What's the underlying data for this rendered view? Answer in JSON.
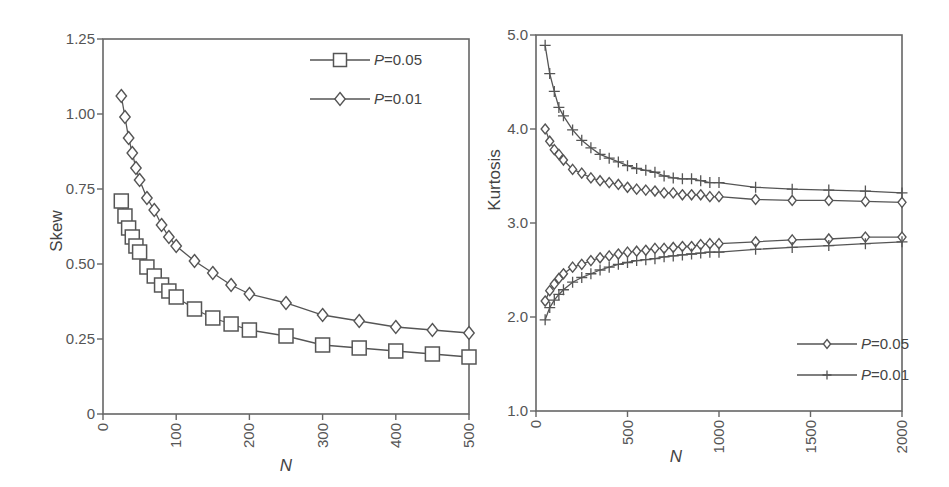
{
  "chart_data": [
    {
      "type": "line",
      "title": "",
      "xlabel": "N",
      "ylabel": "Skew",
      "xlim": [
        0,
        500
      ],
      "ylim": [
        0,
        1.25
      ],
      "xticks": [
        "0",
        "100",
        "200",
        "300",
        "400",
        "500"
      ],
      "yticks": [
        "0",
        "0.25",
        "0.50",
        "0.75",
        "1.00",
        "1.25"
      ],
      "grid": false,
      "legend_position": "upper right",
      "series": [
        {
          "name": "P=0.05",
          "marker": "square",
          "x": [
            25,
            30,
            35,
            40,
            45,
            50,
            60,
            70,
            80,
            90,
            100,
            125,
            150,
            175,
            200,
            250,
            300,
            350,
            400,
            450,
            500
          ],
          "values": [
            0.71,
            0.66,
            0.62,
            0.59,
            0.56,
            0.54,
            0.49,
            0.46,
            0.43,
            0.41,
            0.39,
            0.35,
            0.32,
            0.3,
            0.28,
            0.26,
            0.23,
            0.22,
            0.21,
            0.2,
            0.19
          ]
        },
        {
          "name": "P=0.01",
          "marker": "diamond",
          "x": [
            25,
            30,
            35,
            40,
            45,
            50,
            60,
            70,
            80,
            90,
            100,
            125,
            150,
            175,
            200,
            250,
            300,
            350,
            400,
            450,
            500
          ],
          "values": [
            1.06,
            0.99,
            0.92,
            0.87,
            0.82,
            0.78,
            0.72,
            0.68,
            0.63,
            0.59,
            0.56,
            0.51,
            0.47,
            0.43,
            0.4,
            0.37,
            0.33,
            0.31,
            0.29,
            0.28,
            0.27
          ]
        }
      ]
    },
    {
      "type": "line",
      "title": "",
      "xlabel": "N",
      "ylabel": "Kurtosis",
      "xlim": [
        0,
        2000
      ],
      "ylim": [
        1.0,
        5.0
      ],
      "xticks": [
        "0",
        "500",
        "1000",
        "1500",
        "2000"
      ],
      "yticks": [
        "1.0",
        "2.0",
        "3.0",
        "4.0",
        "5.0"
      ],
      "grid": false,
      "legend_position": "lower right",
      "series": [
        {
          "name": "P=0.05 (upper)",
          "marker": "diamond",
          "x": [
            50,
            75,
            100,
            125,
            150,
            200,
            250,
            300,
            350,
            400,
            450,
            500,
            550,
            600,
            650,
            700,
            750,
            800,
            850,
            900,
            950,
            1000,
            1200,
            1400,
            1600,
            1800,
            2000
          ],
          "values": [
            4.0,
            3.87,
            3.78,
            3.73,
            3.67,
            3.57,
            3.53,
            3.48,
            3.45,
            3.43,
            3.41,
            3.38,
            3.36,
            3.35,
            3.34,
            3.32,
            3.32,
            3.3,
            3.3,
            3.3,
            3.28,
            3.28,
            3.25,
            3.24,
            3.24,
            3.23,
            3.22
          ]
        },
        {
          "name": "P=0.05 (lower)",
          "marker": "diamond",
          "x": [
            50,
            75,
            100,
            125,
            150,
            200,
            250,
            300,
            350,
            400,
            450,
            500,
            550,
            600,
            650,
            700,
            750,
            800,
            850,
            900,
            950,
            1000,
            1200,
            1400,
            1600,
            1800,
            2000
          ],
          "values": [
            2.17,
            2.28,
            2.35,
            2.41,
            2.46,
            2.53,
            2.56,
            2.6,
            2.63,
            2.65,
            2.67,
            2.69,
            2.7,
            2.71,
            2.73,
            2.73,
            2.74,
            2.75,
            2.75,
            2.77,
            2.78,
            2.78,
            2.8,
            2.82,
            2.83,
            2.85,
            2.85
          ]
        },
        {
          "name": "P=0.01 (upper)",
          "marker": "plus",
          "x": [
            50,
            75,
            100,
            125,
            150,
            200,
            250,
            300,
            350,
            400,
            450,
            500,
            550,
            600,
            650,
            700,
            750,
            800,
            850,
            900,
            950,
            1000,
            1200,
            1400,
            1600,
            1800,
            2000
          ],
          "values": [
            4.89,
            4.59,
            4.4,
            4.23,
            4.14,
            3.99,
            3.88,
            3.8,
            3.73,
            3.69,
            3.65,
            3.61,
            3.58,
            3.56,
            3.54,
            3.5,
            3.48,
            3.47,
            3.47,
            3.45,
            3.43,
            3.43,
            3.38,
            3.36,
            3.35,
            3.34,
            3.32
          ]
        },
        {
          "name": "P=0.01 (lower)",
          "marker": "plus",
          "x": [
            50,
            75,
            100,
            125,
            150,
            200,
            250,
            300,
            350,
            400,
            450,
            500,
            550,
            600,
            650,
            700,
            750,
            800,
            850,
            900,
            950,
            1000,
            1200,
            1400,
            1600,
            1800,
            2000
          ],
          "values": [
            1.97,
            2.1,
            2.18,
            2.24,
            2.29,
            2.37,
            2.42,
            2.46,
            2.5,
            2.53,
            2.56,
            2.58,
            2.6,
            2.61,
            2.62,
            2.64,
            2.65,
            2.66,
            2.67,
            2.68,
            2.69,
            2.69,
            2.72,
            2.74,
            2.76,
            2.78,
            2.8
          ]
        }
      ],
      "legend": [
        {
          "name": "P=0.05",
          "marker": "diamond"
        },
        {
          "name": "P=0.01",
          "marker": "plus"
        }
      ]
    }
  ],
  "left_chart": {
    "ylabel": "Skew",
    "xlabel": "N",
    "legend": [
      {
        "p": "P",
        "rest": "=0.05",
        "marker": "square"
      },
      {
        "p": "P",
        "rest": "=0.01",
        "marker": "diamond"
      }
    ]
  },
  "right_chart": {
    "ylabel": "Kurtosis",
    "xlabel": "N",
    "legend": [
      {
        "p": "P",
        "rest": "=0.05",
        "marker": "diamond"
      },
      {
        "p": "P",
        "rest": "=0.01",
        "marker": "plus"
      }
    ]
  },
  "colors": {
    "axis": "#666666",
    "line": "#555555",
    "text": "#555555",
    "background": "#ffffff"
  }
}
